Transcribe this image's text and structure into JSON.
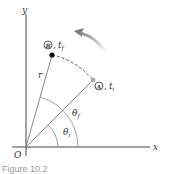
{
  "diagram": {
    "axis_x_label": "x",
    "axis_y_label": "y",
    "origin_label": "O",
    "radius_label": "r",
    "point_a": {
      "symbol": "A",
      "time": "t",
      "time_sub": "i"
    },
    "point_b": {
      "symbol": "B",
      "time": "t",
      "time_sub": "f"
    },
    "angle_initial": {
      "symbol": "θ",
      "sub": "i"
    },
    "angle_final": {
      "symbol": "θ",
      "sub": "f"
    },
    "rotation_arrow": "counterclockwise",
    "colors": {
      "axis": "#444444",
      "radius": "#888888",
      "point_b": "#111111",
      "point_a": "#999999",
      "arrow": "#777777"
    }
  },
  "caption": "Figure 10.2"
}
